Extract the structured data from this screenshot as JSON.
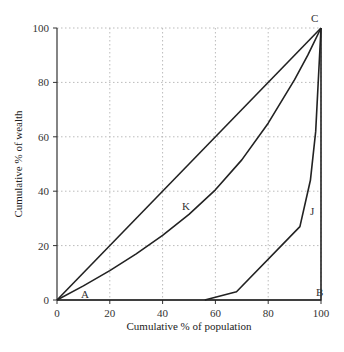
{
  "chart_data": {
    "type": "line",
    "title": "",
    "xlabel": "Cumulative % of population",
    "ylabel": "Cumulative  % of wealth",
    "xlim": [
      0,
      100
    ],
    "ylim": [
      0,
      100
    ],
    "xticks": [
      0,
      20,
      40,
      60,
      80,
      100
    ],
    "yticks": [
      0,
      20,
      40,
      60,
      80,
      100
    ],
    "grid": "dotted",
    "legend": null,
    "series": [
      {
        "name": "Line of equality (A-C)",
        "points": [
          [
            0,
            0
          ],
          [
            100,
            100
          ]
        ]
      },
      {
        "name": "K",
        "points": [
          [
            0,
            0
          ],
          [
            10,
            5.2
          ],
          [
            20,
            10.8
          ],
          [
            30,
            17
          ],
          [
            40,
            23.8
          ],
          [
            50,
            31.5
          ],
          [
            60,
            40.5
          ],
          [
            70,
            51.5
          ],
          [
            80,
            65
          ],
          [
            90,
            81
          ],
          [
            95,
            90
          ],
          [
            100,
            100
          ]
        ]
      },
      {
        "name": "J",
        "points": [
          [
            56,
            0
          ],
          [
            68,
            3
          ],
          [
            92,
            27
          ],
          [
            96,
            44
          ],
          [
            98,
            62
          ],
          [
            100,
            100
          ]
        ]
      },
      {
        "name": "Perfect inequality (A-B-C)",
        "points": [
          [
            0,
            0
          ],
          [
            100,
            0
          ],
          [
            100,
            100
          ]
        ]
      }
    ],
    "annotations": [
      {
        "text": "A",
        "x": 10,
        "y": 1
      },
      {
        "text": "B",
        "x": 100,
        "y": 3
      },
      {
        "text": "C",
        "x": 100,
        "y": 103
      },
      {
        "text": "K",
        "x": 49,
        "y": 34
      },
      {
        "text": "J",
        "x": 98,
        "y": 23
      }
    ]
  },
  "axes": {
    "x_title": "Cumulative % of population",
    "y_title": "Cumulative  % of wealth",
    "x_ticks": [
      "0",
      "20",
      "40",
      "60",
      "80",
      "100"
    ],
    "y_ticks": [
      "0",
      "20",
      "40",
      "60",
      "80",
      "100"
    ]
  },
  "labels": {
    "A": "A",
    "B": "B",
    "C": "C",
    "K": "K",
    "J": "J"
  },
  "colors": {
    "line": "#222222",
    "grid": "#bbbbbb",
    "axis": "#333333"
  }
}
